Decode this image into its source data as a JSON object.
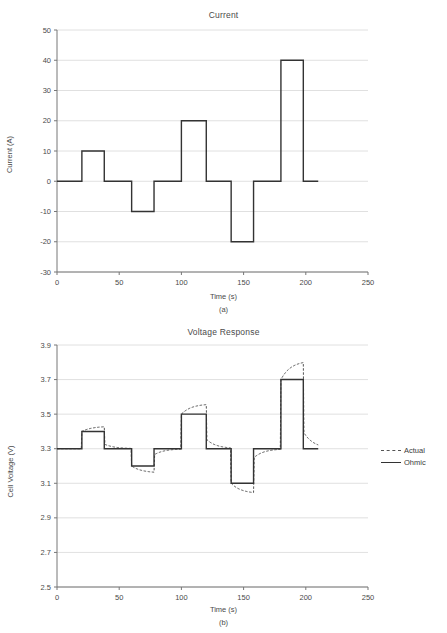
{
  "figure": {
    "panels": [
      {
        "caption": "(a)",
        "chart_data": {
          "type": "line",
          "title": "Current",
          "xlabel": "Time (s)",
          "ylabel": "Current (A)",
          "xlim": [
            0,
            250
          ],
          "ylim": [
            -30,
            50
          ],
          "xticks": [
            0,
            50,
            100,
            150,
            200,
            250
          ],
          "yticks": [
            -30,
            -20,
            -10,
            0,
            10,
            20,
            30,
            40,
            50
          ],
          "grid": true,
          "legend": null,
          "series": [
            {
              "name": "Current",
              "style": "solid",
              "step": "post",
              "x": [
                0,
                20,
                20,
                38,
                38,
                60,
                60,
                78,
                78,
                100,
                100,
                120,
                120,
                140,
                140,
                158,
                158,
                180,
                180,
                198,
                198,
                210
              ],
              "y": [
                0,
                0,
                10,
                10,
                0,
                0,
                -10,
                -10,
                0,
                0,
                20,
                20,
                0,
                0,
                -20,
                -20,
                0,
                0,
                40,
                40,
                0,
                0
              ]
            }
          ],
          "steps": [
            {
              "t_start": 0,
              "t_end": 20,
              "value": 0
            },
            {
              "t_start": 20,
              "t_end": 38,
              "value": 10
            },
            {
              "t_start": 38,
              "t_end": 60,
              "value": 0
            },
            {
              "t_start": 60,
              "t_end": 78,
              "value": -10
            },
            {
              "t_start": 78,
              "t_end": 100,
              "value": 0
            },
            {
              "t_start": 100,
              "t_end": 120,
              "value": 20
            },
            {
              "t_start": 120,
              "t_end": 140,
              "value": 0
            },
            {
              "t_start": 140,
              "t_end": 158,
              "value": -20
            },
            {
              "t_start": 158,
              "t_end": 180,
              "value": 0
            },
            {
              "t_start": 180,
              "t_end": 198,
              "value": 40
            },
            {
              "t_start": 198,
              "t_end": 210,
              "value": 0
            }
          ]
        }
      },
      {
        "caption": "(b)",
        "chart_data": {
          "type": "line",
          "title": "Voltage Response",
          "xlabel": "Time (s)",
          "ylabel": "Cell Voltage (V)",
          "xlim": [
            0,
            250
          ],
          "ylim": [
            2.5,
            3.9
          ],
          "xticks": [
            0,
            50,
            100,
            150,
            200,
            250
          ],
          "yticks": [
            2.5,
            2.7,
            2.9,
            3.1,
            3.3,
            3.5,
            3.7,
            3.9
          ],
          "grid": true,
          "legend": {
            "position": "right",
            "entries": [
              "Actual",
              "Ohmic"
            ]
          },
          "baseline": 3.3,
          "series": [
            {
              "name": "Ohmic",
              "style": "solid",
              "step": "post",
              "x": [
                0,
                20,
                20,
                38,
                38,
                60,
                60,
                78,
                78,
                100,
                100,
                120,
                120,
                140,
                140,
                158,
                158,
                180,
                180,
                198,
                198,
                210
              ],
              "y": [
                3.3,
                3.3,
                3.4,
                3.4,
                3.3,
                3.3,
                3.2,
                3.2,
                3.3,
                3.3,
                3.5,
                3.5,
                3.3,
                3.3,
                3.1,
                3.1,
                3.3,
                3.3,
                3.7,
                3.7,
                3.3,
                3.3
              ]
            },
            {
              "name": "Actual",
              "style": "dashed",
              "description": "RC-relaxation response: each ohmic step is followed by an exponential drift toward a larger magnitude, then decays back to 3.3 V after the pulse ends",
              "pulses": [
                {
                  "t_start": 20,
                  "t_end": 38,
                  "ohmic": 3.4,
                  "peak": 3.43,
                  "tau": 8
                },
                {
                  "t_start": 60,
                  "t_end": 78,
                  "ohmic": 3.2,
                  "peak": 3.16,
                  "tau": 8
                },
                {
                  "t_start": 100,
                  "t_end": 120,
                  "ohmic": 3.5,
                  "peak": 3.56,
                  "tau": 8
                },
                {
                  "t_start": 140,
                  "t_end": 158,
                  "ohmic": 3.1,
                  "peak": 3.04,
                  "tau": 8
                },
                {
                  "t_start": 180,
                  "t_end": 198,
                  "ohmic": 3.7,
                  "peak": 3.81,
                  "tau": 8
                }
              ]
            }
          ]
        }
      }
    ]
  },
  "colors": {
    "background": "#ffffff",
    "axis": "#777777",
    "grid": "#d8d8d8",
    "solid_series": "#333333",
    "dashed_series": "#555555",
    "text": "#4a4a4a"
  }
}
